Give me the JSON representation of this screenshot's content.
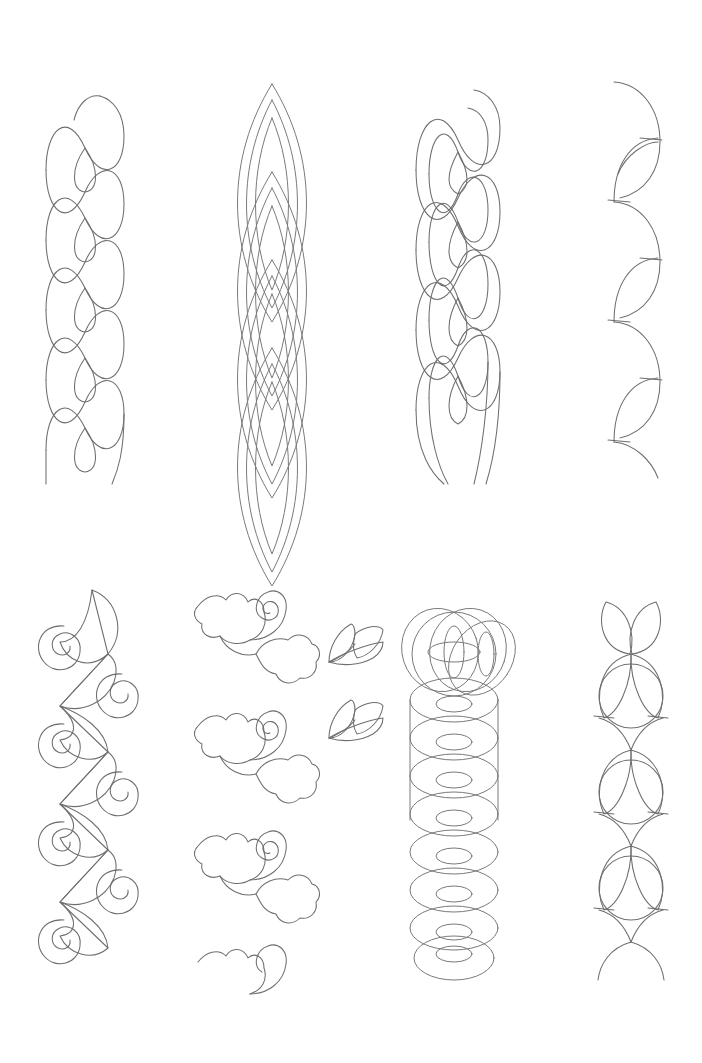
{
  "page": {
    "title": "Quilting Border Pattern Sheet",
    "background_color": "#ffffff",
    "line_color": "#6e6e6e",
    "width": 702,
    "height": 1063,
    "rows": 2,
    "columns": 4
  },
  "patterns": [
    {
      "id": "p1",
      "name": "two-strand-cable-braid",
      "label": "Two-Strand Cable Braid",
      "row": 1,
      "column": 1,
      "x": 38,
      "y": 70,
      "width": 94,
      "height": 420,
      "repeats": 4,
      "stroke": "#6e6e6e"
    },
    {
      "id": "p2",
      "name": "nested-vesica-chain",
      "label": "Nested Vesica Chain",
      "row": 1,
      "column": 2,
      "x": 222,
      "y": 72,
      "width": 100,
      "height": 420,
      "repeats": 4,
      "stroke": "#6e6e6e"
    },
    {
      "id": "p3",
      "name": "double-cable-with-inner-oval",
      "label": "Double Cable With Inner Oval",
      "row": 1,
      "column": 3,
      "x": 410,
      "y": 70,
      "width": 96,
      "height": 420,
      "repeats": 4,
      "stroke": "#6e6e6e"
    },
    {
      "id": "p4",
      "name": "alternating-arc-scallop",
      "label": "Alternating Arc Scallop",
      "row": 1,
      "column": 4,
      "x": 606,
      "y": 78,
      "width": 58,
      "height": 400,
      "repeats": 6,
      "stroke": "#6e6e6e"
    },
    {
      "id": "p5",
      "name": "spiral-and-leaf-vine",
      "label": "Spiral And Leaf Vine",
      "row": 2,
      "column": 1,
      "x": 30,
      "y": 586,
      "width": 112,
      "height": 390,
      "repeats": 5,
      "stroke": "#6e6e6e"
    },
    {
      "id": "p6",
      "name": "rose-and-tulip-vine",
      "label": "Rose And Tulip Vine",
      "row": 2,
      "column": 2,
      "x": 192,
      "y": 590,
      "width": 120,
      "height": 390,
      "repeats": 5,
      "stroke": "#6e6e6e"
    },
    {
      "id": "p6b",
      "name": "three-leaf-sprig-motifs",
      "label": "Three-Leaf Sprig Motifs",
      "row": 2,
      "column": 2,
      "x": 325,
      "y": 622,
      "width": 60,
      "height": 130,
      "count": 2,
      "stroke": "#6e6e6e"
    },
    {
      "id": "p7",
      "name": "rosette-and-lens-stack",
      "label": "Rosette And Lens Stack",
      "row": 2,
      "column": 3,
      "x": 406,
      "y": 592,
      "width": 112,
      "height": 388,
      "repeats": 6,
      "stroke": "#6e6e6e"
    },
    {
      "id": "p8",
      "name": "petal-and-circle-chain",
      "label": "Petal And Circle Chain",
      "row": 2,
      "column": 4,
      "x": 592,
      "y": 592,
      "width": 76,
      "height": 388,
      "repeats": 4,
      "stroke": "#6e6e6e"
    }
  ]
}
